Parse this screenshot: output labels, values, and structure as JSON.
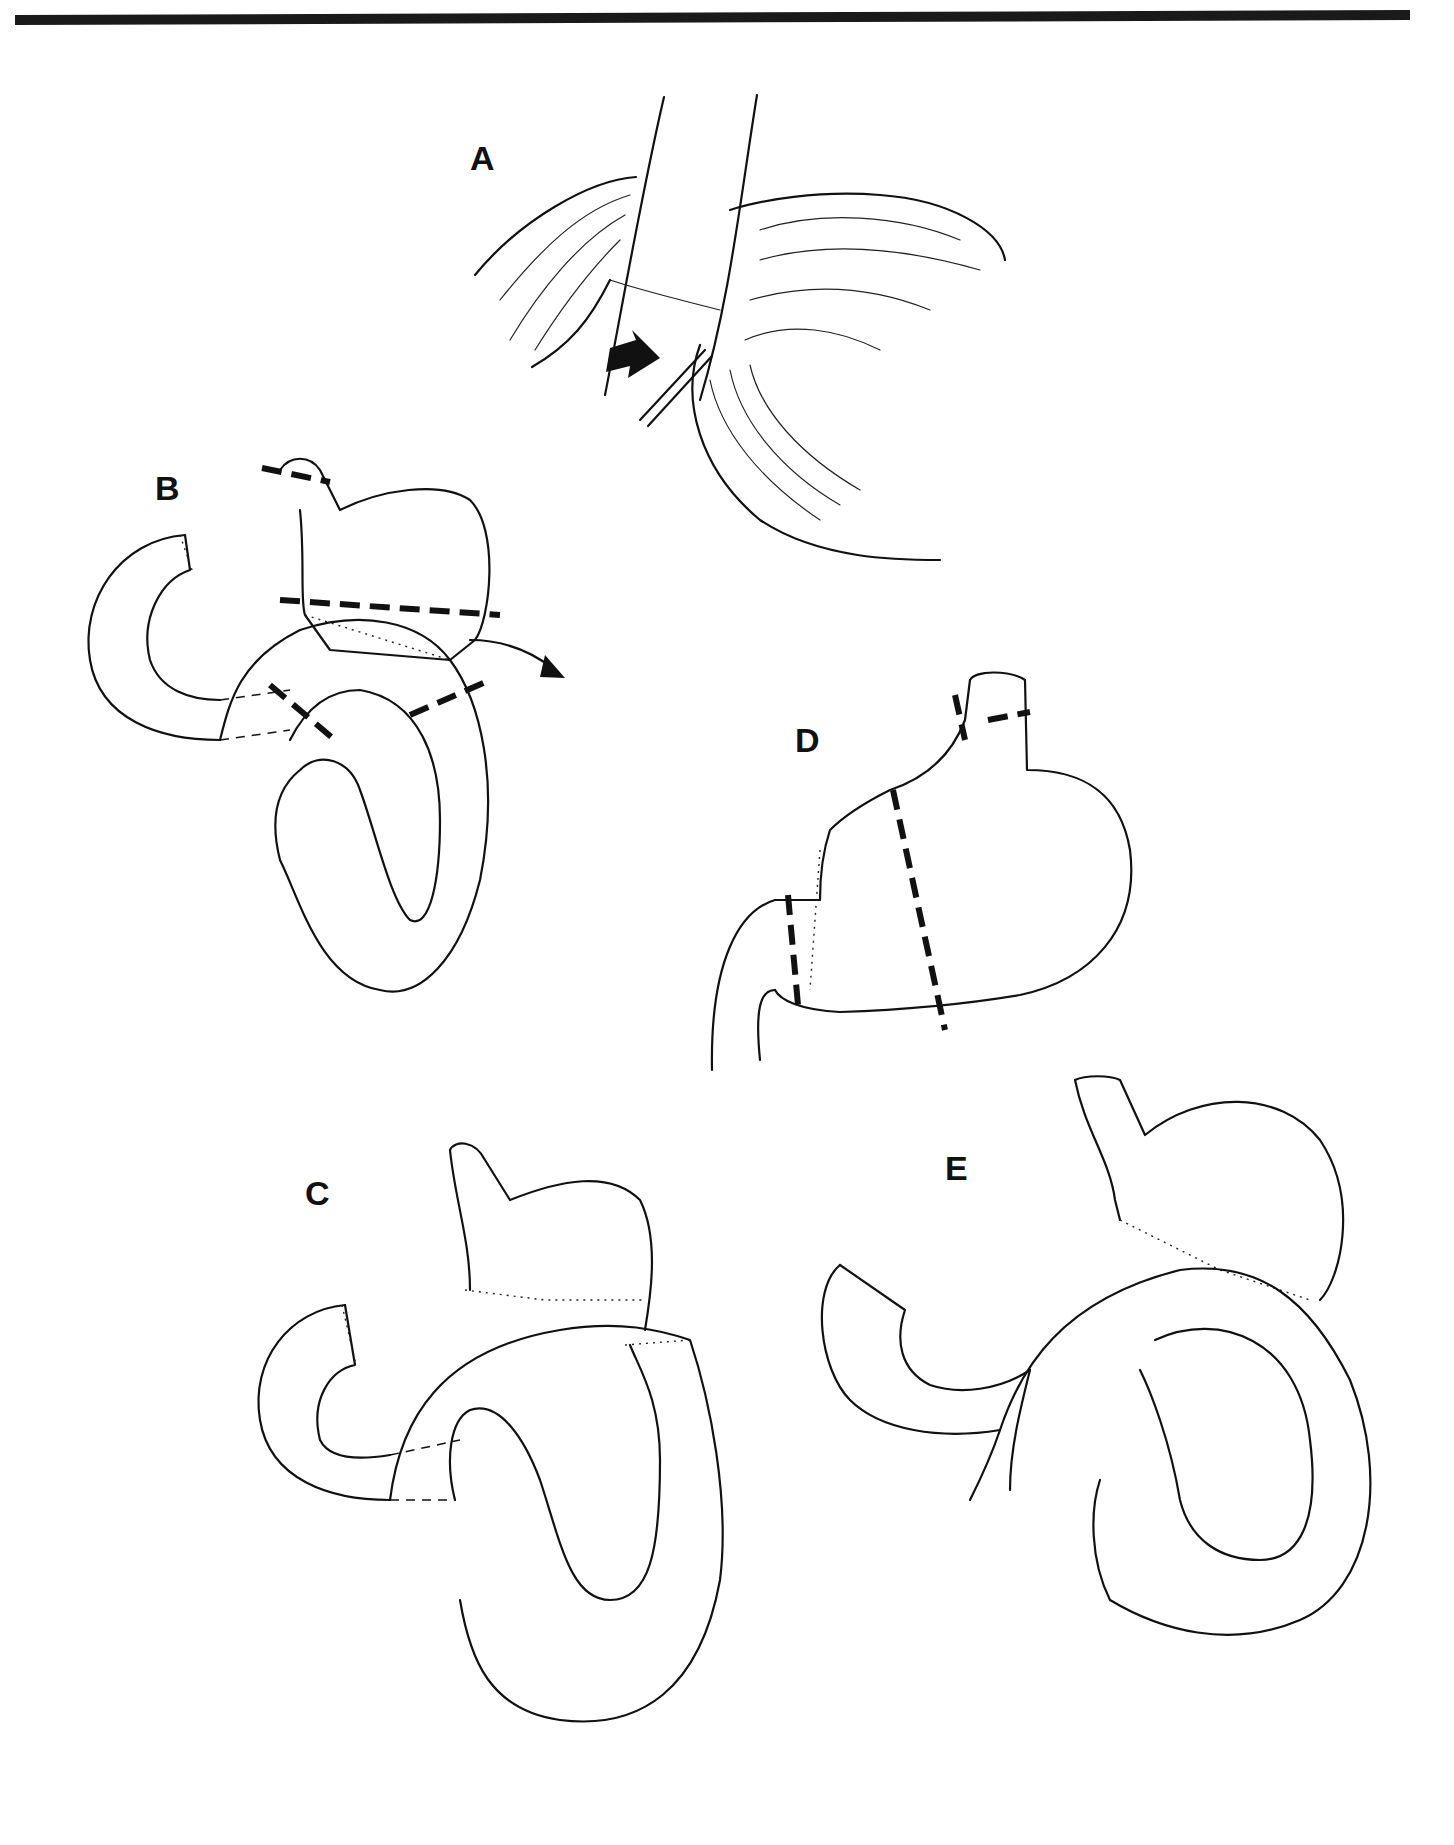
{
  "figure": {
    "top_rule": {
      "color": "#1a1a1a"
    },
    "panels": [
      {
        "id": "A",
        "label": "A",
        "description": "Surgical view with retractor and arrow indicating vessel/suture near stomach"
      },
      {
        "id": "B",
        "label": "B",
        "description": "Stomach with dashed resection lines and curved arrow over looped jejunum"
      },
      {
        "id": "C",
        "label": "C",
        "description": "Reconstruction with sutured anastomoses"
      },
      {
        "id": "D",
        "label": "D",
        "description": "Stomach with dashed transection lines and sutured segment"
      },
      {
        "id": "E",
        "label": "E",
        "description": "Final reconstruction with stomach pouch and looped bowel"
      }
    ],
    "line_color": "#111111",
    "background": "#ffffff"
  }
}
